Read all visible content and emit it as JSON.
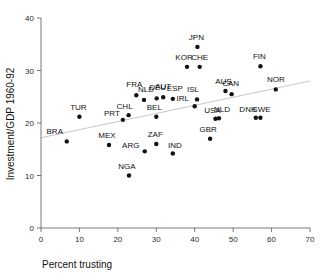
{
  "chart_data": {
    "type": "scatter",
    "title": "",
    "xlabel": "Percent trusting",
    "ylabel": "Investment/GDP 1960-92",
    "xlim": [
      0,
      70
    ],
    "ylim": [
      0,
      40
    ],
    "xticks": [
      0,
      10,
      20,
      30,
      40,
      50,
      60,
      70
    ],
    "yticks": [
      0,
      10,
      20,
      30,
      40
    ],
    "grid": false,
    "legend": "none",
    "marker_color": "#111111",
    "trendline_color": "#c9c9c9",
    "trendline": {
      "x": [
        0,
        70
      ],
      "y": [
        17.2,
        28.0
      ],
      "label": "regression line"
    },
    "points": [
      {
        "label": "BRA",
        "x": 6.7,
        "y": 16.5,
        "lx": -12,
        "ly": -7
      },
      {
        "label": "TUR",
        "x": 10.0,
        "y": 21.2,
        "lx": -1,
        "ly": -7
      },
      {
        "label": "MEX",
        "x": 17.7,
        "y": 15.8,
        "lx": -2,
        "ly": -7
      },
      {
        "label": "PRT",
        "x": 21.3,
        "y": 20.6,
        "lx": -11,
        "ly": -4
      },
      {
        "label": "CHL",
        "x": 22.8,
        "y": 21.5,
        "lx": -4,
        "ly": -6
      },
      {
        "label": "NGA",
        "x": 22.9,
        "y": 10.0,
        "lx": -2,
        "ly": -7
      },
      {
        "label": "FRA",
        "x": 24.8,
        "y": 25.3,
        "lx": -2,
        "ly": -8
      },
      {
        "label": "ARG",
        "x": 27.0,
        "y": 14.6,
        "lx": -14,
        "ly": -3
      },
      {
        "label": "NLD",
        "x": 26.8,
        "y": 24.4,
        "lx": 2,
        "ly": -8
      },
      {
        "label": "ZAF",
        "x": 30.0,
        "y": 16.0,
        "lx": -1,
        "ly": -7
      },
      {
        "label": "BEL",
        "x": 30.0,
        "y": 21.2,
        "lx": -2,
        "ly": -7
      },
      {
        "label": "DEU",
        "x": 30.1,
        "y": 24.7,
        "lx": 1,
        "ly": -8
      },
      {
        "label": "AUT",
        "x": 31.8,
        "y": 24.9,
        "lx": 0,
        "ly": -8
      },
      {
        "label": "ESP",
        "x": 34.3,
        "y": 24.6,
        "lx": 2,
        "ly": -8
      },
      {
        "label": "IND",
        "x": 34.3,
        "y": 14.2,
        "lx": 2,
        "ly": -5
      },
      {
        "label": "KOR",
        "x": 38.0,
        "y": 30.7,
        "lx": -3,
        "ly": -7
      },
      {
        "label": "IRL",
        "x": 40.0,
        "y": 23.2,
        "lx": -12,
        "ly": -5
      },
      {
        "label": "ISL",
        "x": 40.6,
        "y": 24.5,
        "lx": -4,
        "ly": -7
      },
      {
        "label": "JPN",
        "x": 40.7,
        "y": 34.5,
        "lx": -1,
        "ly": -7
      },
      {
        "label": "CHE",
        "x": 41.3,
        "y": 30.7,
        "lx": 0,
        "ly": -7
      },
      {
        "label": "GBR",
        "x": 44.0,
        "y": 17.0,
        "lx": -2,
        "ly": -7
      },
      {
        "label": "USA",
        "x": 45.4,
        "y": 20.8,
        "lx": -3,
        "ly": -6
      },
      {
        "label": "NLD2",
        "x": 46.3,
        "y": 20.9,
        "lx": 3,
        "ly": -6,
        "display": "NLD"
      },
      {
        "label": "AUS",
        "x": 48.0,
        "y": 26.1,
        "lx": -2,
        "ly": -7
      },
      {
        "label": "CAN",
        "x": 49.6,
        "y": 25.5,
        "lx": -1,
        "ly": -8
      },
      {
        "label": "DNK",
        "x": 55.9,
        "y": 21.0,
        "lx": -8,
        "ly": -6
      },
      {
        "label": "SWE",
        "x": 57.1,
        "y": 21.0,
        "lx": 1,
        "ly": -6
      },
      {
        "label": "FIN",
        "x": 57.1,
        "y": 30.8,
        "lx": -1,
        "ly": -7
      },
      {
        "label": "NOR",
        "x": 61.1,
        "y": 26.4,
        "lx": 0,
        "ly": -7
      }
    ]
  }
}
